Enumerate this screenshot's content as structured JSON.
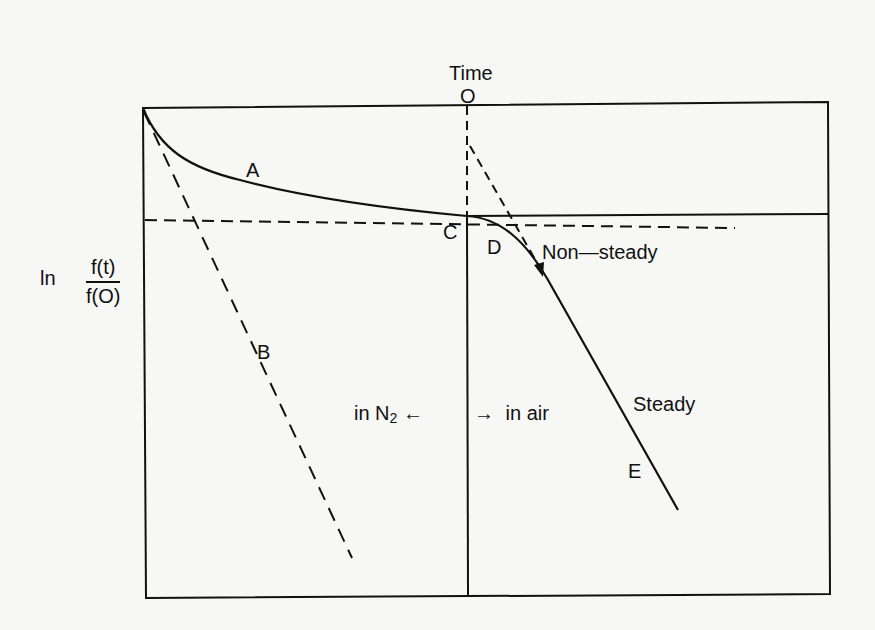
{
  "title": "Time",
  "origin_label": "O",
  "y_axis": {
    "prefix": "ln",
    "numerator": "f(t)",
    "denominator": "f(O)"
  },
  "curve_labels": {
    "a": "A",
    "b": "B",
    "c": "C",
    "d": "D",
    "e": "E"
  },
  "annotations": {
    "non_steady": "Non—steady",
    "steady": "Steady",
    "in_n2": "in N",
    "n2_subscript": "2",
    "in_air": "in air",
    "arrow_left": "←",
    "arrow_right": "→"
  },
  "colors": {
    "line": "#111111",
    "background": "#f7f7f5"
  }
}
